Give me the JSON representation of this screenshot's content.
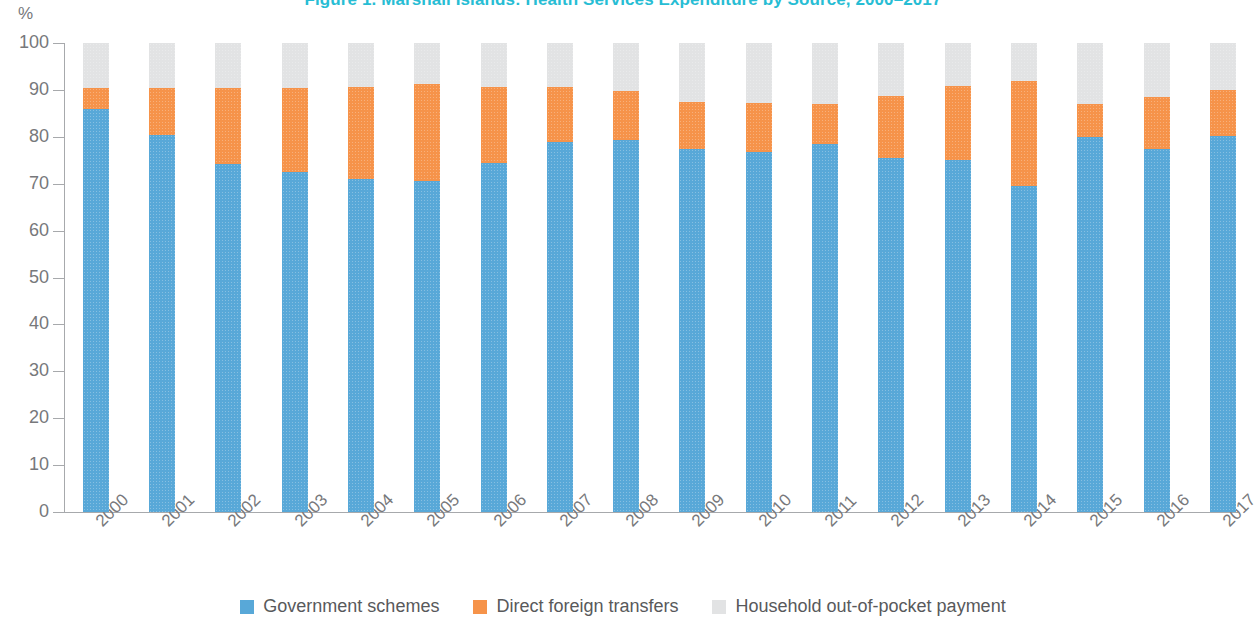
{
  "figure": {
    "title": "Figure 1. Marshall Islands: Health Services Expenditure by Source, 2000–2017",
    "y_axis_unit": "%"
  },
  "legend": {
    "items": [
      {
        "label": "Government schemes",
        "color": "#58a8d8",
        "key": "government_schemes"
      },
      {
        "label": "Direct foreign transfers",
        "color": "#f6934a",
        "key": "direct_foreign_transfers"
      },
      {
        "label": "Household out-of-pocket payment",
        "color": "#e2e3e4",
        "key": "household_out_of_pocket"
      }
    ]
  },
  "chart_data": {
    "type": "bar",
    "stacked": true,
    "title": "Figure 1. Marshall Islands: Health Services Expenditure by Source, 2000–2017",
    "xlabel": "",
    "ylabel": "%",
    "ylim": [
      0,
      100
    ],
    "yticks": [
      0,
      10,
      20,
      30,
      40,
      50,
      60,
      70,
      80,
      90,
      100
    ],
    "grid": false,
    "legend_position": "bottom",
    "categories": [
      "2000",
      "2001",
      "2002",
      "2003",
      "2004",
      "2005",
      "2006",
      "2007",
      "2008",
      "2009",
      "2010",
      "2011",
      "2012",
      "2013",
      "2014",
      "2015",
      "2016",
      "2017"
    ],
    "series": [
      {
        "name": "Government schemes",
        "color": "#58a8d8",
        "values": [
          86.0,
          80.3,
          74.2,
          72.5,
          71.0,
          70.5,
          74.5,
          79.0,
          79.4,
          77.3,
          76.8,
          78.4,
          75.4,
          75.0,
          69.6,
          79.9,
          77.5,
          80.2
        ]
      },
      {
        "name": "Direct foreign transfers",
        "color": "#f6934a",
        "values": [
          4.5,
          10.2,
          16.3,
          17.9,
          19.7,
          20.8,
          16.1,
          11.6,
          10.4,
          10.2,
          10.4,
          8.5,
          13.2,
          15.9,
          22.3,
          7.2,
          11.0,
          9.8
        ]
      },
      {
        "name": "Household out-of-pocket payment",
        "color": "#e2e3e4",
        "values": [
          9.5,
          9.5,
          9.5,
          9.6,
          9.3,
          8.7,
          9.4,
          9.4,
          10.2,
          12.5,
          12.8,
          13.1,
          11.4,
          9.1,
          8.1,
          12.9,
          11.5,
          10.0
        ]
      }
    ]
  }
}
